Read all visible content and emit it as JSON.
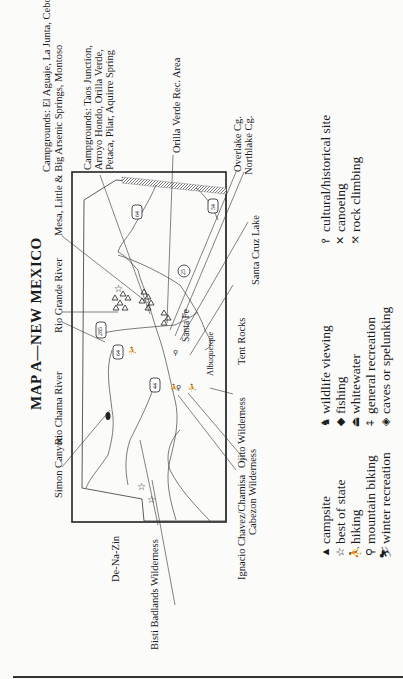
{
  "page": {
    "title": "MAP A—NEW MEXICO",
    "orientation": "rotated 90 degrees counter-clockwise"
  },
  "map_labels": {
    "campgrounds_1_line1": "Campgrounds: El Aguaje, La Junta, Cebolla",
    "campgrounds_1_line2": "Mesa, Little & Big Arsenic Springs, Montoso",
    "campgrounds_2_line1": "Campgrounds: Taos Junction,",
    "campgrounds_2_line2": "Arroyo Hondo, Orilla Verde,",
    "campgrounds_2_line3": "Petaca, Pilar, Aquirre Spring",
    "orilla_verde": "Orilla Verde Rec. Area",
    "overlake": "Overlake Cg.",
    "northlake": "Northlake Cg.",
    "santa_cruz_lake": "Santa Cruz Lake",
    "tent_rocks": "Tent Rocks",
    "ojito": "Ojito Wilderness",
    "ignacio": "Ignacio Chavez/Chamisa",
    "cabezon": "Cabezon Wilderness",
    "bisti": "Bisti Badlands Wilderness",
    "de_na_zin": "De-Na-Zin",
    "simon_canyon": "Simon Canyon",
    "rio_chama": "Rio Chama River",
    "rio_grande": "Rio Grande River",
    "santa_fe": "Santa Fe",
    "albuquerque": "Albuquerque"
  },
  "highways": [
    "64",
    "285",
    "64",
    "44",
    "25",
    "54"
  ],
  "legend": {
    "col1": [
      {
        "icon": "campsite-icon",
        "glyph": "▲",
        "label": "campsite"
      },
      {
        "icon": "best-of-state-icon",
        "glyph": "☆",
        "label": "best of state"
      },
      {
        "icon": "hiking-icon",
        "glyph": "⛹",
        "label": "hiking"
      },
      {
        "icon": "mountain-biking-icon",
        "glyph": "⚲",
        "label": "mountain biking"
      },
      {
        "icon": "winter-recreation-icon",
        "glyph": "⛷",
        "label": "winter recreation"
      }
    ],
    "col2": [
      {
        "icon": "wildlife-viewing-icon",
        "glyph": "♞",
        "label": "wildlife viewing"
      },
      {
        "icon": "fishing-icon",
        "glyph": "◆",
        "label": "fishing"
      },
      {
        "icon": "whitewater-icon",
        "glyph": "⏏",
        "label": "whitewater"
      },
      {
        "icon": "general-recreation-icon",
        "glyph": "⍏",
        "label": "general recreation"
      },
      {
        "icon": "caves-icon",
        "glyph": "◈",
        "label": "caves or spelunking"
      }
    ],
    "col3": [
      {
        "icon": "cultural-site-icon",
        "glyph": "⫯",
        "label": "cultural/historical site"
      },
      {
        "icon": "canoeing-icon",
        "glyph": "✕",
        "label": "canoeing"
      },
      {
        "icon": "rock-climbing-icon",
        "glyph": "⤧",
        "label": "rock climbing"
      }
    ]
  }
}
